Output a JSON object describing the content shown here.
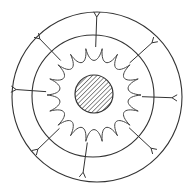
{
  "diagram": {
    "title": "Cell cross-section with nucleus, wavy membrane and receptor branches",
    "stroke_color": "#333333",
    "background_color": "#ffffff",
    "outer_ring": {
      "cx": 97,
      "cy": 97,
      "r": 85
    },
    "inner_ring": {
      "cx": 93,
      "cy": 96,
      "r": 61
    },
    "nucleus": {
      "cx": 94,
      "cy": 94,
      "r": 19,
      "fill": "hatched"
    },
    "wavy_membrane": {
      "cx": 94,
      "cy": 95,
      "r_inner": 37,
      "r_outer": 47,
      "scallops": 18
    },
    "branches": [
      {
        "angle_deg": -88
      },
      {
        "angle_deg": -42
      },
      {
        "angle_deg": 2
      },
      {
        "angle_deg": 43
      },
      {
        "angle_deg": 98
      },
      {
        "angle_deg": 136
      },
      {
        "angle_deg": 184
      },
      {
        "angle_deg": 226
      }
    ],
    "branch_r_start": 48,
    "branch_r_end": 78
  }
}
